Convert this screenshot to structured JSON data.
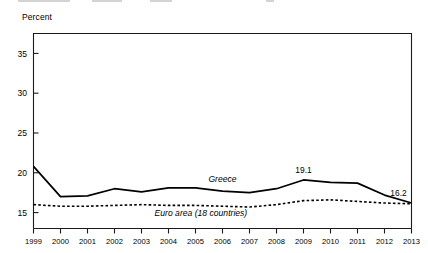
{
  "axis_title": "Percent",
  "series_labels": {
    "greece": "Greece",
    "euro": "Euro area (18 countries)"
  },
  "value_labels": {
    "peak": "19.1",
    "end": "16.2"
  },
  "colors": {
    "line": "#000000",
    "axis": "#1a1a1a",
    "background": "#ffffff"
  },
  "chart_data": {
    "type": "line",
    "title": "",
    "subtitle": "",
    "xlabel": "",
    "ylabel": "Percent",
    "grid": false,
    "legend_position": "inline-annotation",
    "x": [
      1999,
      2000,
      2001,
      2002,
      2003,
      2004,
      2005,
      2006,
      2007,
      2008,
      2009,
      2010,
      2011,
      2012,
      2013
    ],
    "xlim": [
      1999,
      2013
    ],
    "ylim": [
      13,
      37.5
    ],
    "yticks": [
      15,
      20,
      25,
      30,
      35
    ],
    "xticks": [
      "1999",
      "2000",
      "2001",
      "2002",
      "2003",
      "2004",
      "2005",
      "2006",
      "2007",
      "2008",
      "2009",
      "2010",
      "2011",
      "2012",
      "2013"
    ],
    "annotations": [
      {
        "text": "19.1",
        "x": 2009,
        "y": 19.1
      },
      {
        "text": "16.2",
        "x": 2013,
        "y": 16.2
      },
      {
        "text": "Greece",
        "x": 2006,
        "y": 18.9
      },
      {
        "text": "Euro area (18 countries)",
        "x": 2005.2,
        "y": 14.6
      }
    ],
    "series": [
      {
        "name": "Greece",
        "style": "solid",
        "values": [
          20.8,
          17.0,
          17.1,
          18.0,
          17.6,
          18.1,
          18.1,
          17.7,
          17.5,
          18.0,
          19.1,
          18.8,
          18.7,
          17.2,
          16.2
        ]
      },
      {
        "name": "Euro area (18 countries)",
        "style": "dashed",
        "values": [
          16.0,
          15.8,
          15.8,
          15.9,
          16.0,
          15.9,
          15.9,
          15.8,
          15.7,
          16.0,
          16.5,
          16.6,
          16.4,
          16.2,
          16.1
        ]
      }
    ]
  }
}
